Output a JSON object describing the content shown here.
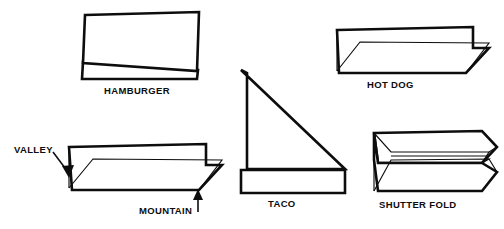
{
  "figure": {
    "background_color": "#ffffff",
    "ink_color": "#0d0d0d",
    "width": 504,
    "height": 229
  },
  "folds": [
    {
      "id": "hamburger",
      "label": "HAMBURGER",
      "icon": "hamburger-fold-icon",
      "description": "Sheet folded in half across the short dimension, shown standing like a tent with a small flap below."
    },
    {
      "id": "hot-dog",
      "label": "HOT DOG",
      "icon": "hot-dog-fold-icon",
      "description": "Sheet folded in half lengthwise, shown as a long shallow tent."
    },
    {
      "id": "valley-mountain",
      "label": "",
      "icon": "valley-mountain-fold-icon",
      "description": "Long lengthwise fold annotated with valley and mountain crease callouts."
    },
    {
      "id": "taco",
      "label": "TACO",
      "icon": "taco-fold-icon",
      "description": "Sheet folded corner to corner on the diagonal forming a right triangle with a base flap."
    },
    {
      "id": "shutter-fold",
      "label": "SHUTTER FOLD",
      "icon": "shutter-fold-icon",
      "description": "Both long edges folded inward to meet at the center line."
    }
  ],
  "annotations": [
    {
      "id": "valley",
      "label": "VALLEY",
      "arrow": "arrow-down-right"
    },
    {
      "id": "mountain",
      "label": "MOUNTAIN",
      "arrow": "arrow-up"
    }
  ]
}
